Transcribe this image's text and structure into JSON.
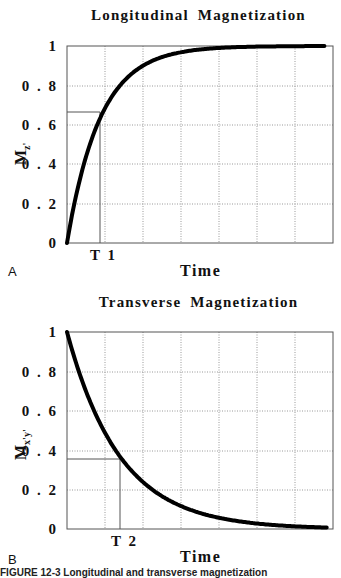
{
  "figure": {
    "caption_partial": "FIGURE 12-3  Longitudinal and transverse magnetization"
  },
  "panels": [
    {
      "id": "A",
      "label": "A",
      "title": "Longitudinal Magnetization",
      "ylabel_main": "M",
      "ylabel_sub": "z'",
      "xlabel": "Time",
      "marker_label": "T 1",
      "yticks": [
        "1",
        "0 . 8",
        "0 . 6",
        "0 . 4",
        "0 . 2",
        "0"
      ]
    },
    {
      "id": "B",
      "label": "B",
      "title": "Transverse Magnetization",
      "ylabel_main": "M",
      "ylabel_sub": "x'y'",
      "xlabel": "Time",
      "marker_label": "T 2",
      "yticks": [
        "1",
        "0 . 8",
        "0 . 6",
        "0 . 4",
        "0 . 2",
        "0"
      ]
    }
  ],
  "chart_data": [
    {
      "type": "line",
      "title": "Longitudinal Magnetization",
      "xlabel": "Time",
      "ylabel": "Mz'",
      "ylim": [
        0,
        1
      ],
      "yticks": [
        0,
        0.2,
        0.4,
        0.6,
        0.8,
        1
      ],
      "grid": true,
      "x_units": "multiples of T1",
      "xlim": [
        0,
        7.8
      ],
      "annotation": {
        "label": "T 1",
        "x": 1.0,
        "y": 0.63
      },
      "series": [
        {
          "name": "Mz' = 1 - exp(-t/T1)",
          "x": [
            0,
            0.5,
            1,
            1.5,
            2,
            3,
            4,
            5,
            6,
            7,
            7.8
          ],
          "values": [
            0,
            0.39,
            0.63,
            0.78,
            0.86,
            0.95,
            0.98,
            0.99,
            1.0,
            1.0,
            1.0
          ]
        }
      ]
    },
    {
      "type": "line",
      "title": "Transverse Magnetization",
      "xlabel": "Time",
      "ylabel": "Mx'y'",
      "ylim": [
        0,
        1
      ],
      "yticks": [
        0,
        0.2,
        0.4,
        0.6,
        0.8,
        1
      ],
      "grid": true,
      "x_units": "multiples of T2",
      "xlim": [
        0,
        4.9
      ],
      "annotation": {
        "label": "T 2",
        "x": 1.0,
        "y": 0.37
      },
      "series": [
        {
          "name": "Mx'y' = exp(-t/T2)",
          "x": [
            0,
            0.5,
            1,
            1.5,
            2,
            2.5,
            3,
            3.5,
            4,
            4.5,
            4.9
          ],
          "values": [
            1.0,
            0.61,
            0.37,
            0.22,
            0.14,
            0.08,
            0.05,
            0.03,
            0.02,
            0.01,
            0.007
          ]
        }
      ]
    }
  ]
}
